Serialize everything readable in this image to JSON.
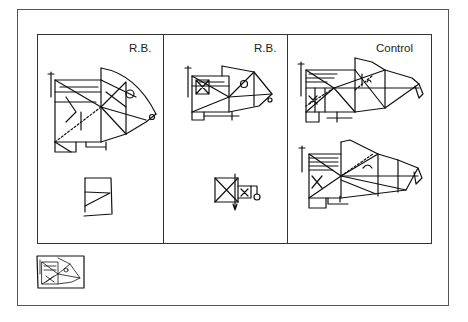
{
  "figure": {
    "panels": [
      {
        "label": "R.B.",
        "type": "copy-and-recall"
      },
      {
        "label": "R.B.",
        "type": "copy-and-recall"
      },
      {
        "label": "Control",
        "type": "copy-and-recall"
      }
    ],
    "thumbnail": {
      "description": "small reference figure"
    }
  }
}
